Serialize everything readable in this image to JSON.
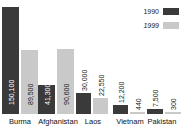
{
  "chart_data": {
    "type": "bar",
    "title": "",
    "subtitle": "",
    "xlabel": "",
    "ylabel": "",
    "grid": false,
    "legend_position": "top-right",
    "ylim": [
      0,
      160000
    ],
    "categories": [
      "Burma",
      "Afghanistan",
      "Laos",
      "Vietnam",
      "Pakistan"
    ],
    "series": [
      {
        "name": "1990",
        "color": "#3a3a3a",
        "values": [
          150100,
          41300,
          30000,
          12200,
          7500
        ],
        "labels": [
          "150,100",
          "41,300",
          "30,000",
          "12,200",
          "7,500"
        ]
      },
      {
        "name": "1999",
        "color": "#c9c9c9",
        "values": [
          89500,
          90600,
          22550,
          440,
          300
        ],
        "labels": [
          "89,500",
          "90,600",
          "22,550",
          "440",
          "300"
        ]
      }
    ]
  },
  "legend": {
    "items": [
      {
        "label": "1990",
        "color": "#3a3a3a"
      },
      {
        "label": "1999",
        "color": "#c9c9c9"
      }
    ]
  }
}
